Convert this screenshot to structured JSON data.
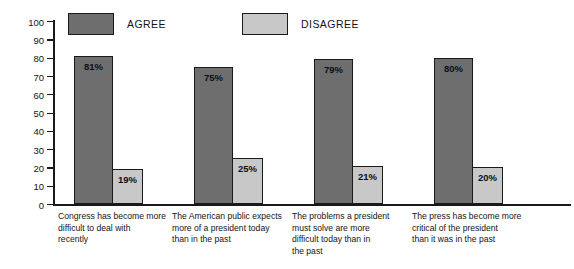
{
  "legend": {
    "entries": [
      {
        "label": "AGREE",
        "color": "#6e6e6e"
      },
      {
        "label": "DISAGREE",
        "color": "#c8c8c8"
      }
    ]
  },
  "axis": {
    "ylabel": "PERCENT OF TOTAL",
    "ticks": [
      "100",
      "90",
      "80",
      "70",
      "60",
      "50",
      "40",
      "30",
      "20",
      "10",
      "0"
    ]
  },
  "chart_data": {
    "type": "bar",
    "title": "",
    "xlabel": "",
    "ylabel": "PERCENT OF TOTAL",
    "ylim": [
      0,
      100
    ],
    "ytick_step": 10,
    "grid": false,
    "legend_position": "top",
    "categories": [
      "Congress has become more difficult to deal with recently",
      "The American public expects more of a president today than in the past",
      "The problems a president must solve are more difficult today than in the past",
      "The press has become more critical of the president than it was in the past"
    ],
    "category_lines": [
      [
        "Congress has become more",
        "difficult to deal with",
        "recently"
      ],
      [
        "The American public expects",
        "more of a president today",
        "than in the past"
      ],
      [
        "The problems a president",
        "must solve are more",
        "difficult today than in",
        "the past"
      ],
      [
        "The press has become more",
        "critical of the president",
        "than it was in the past"
      ]
    ],
    "series": [
      {
        "name": "AGREE",
        "color": "#6e6e6e",
        "values": [
          81,
          75,
          79,
          80
        ],
        "labels": [
          "81%",
          "75%",
          "79%",
          "80%"
        ]
      },
      {
        "name": "DISAGREE",
        "color": "#c8c8c8",
        "values": [
          19,
          25,
          21,
          20
        ],
        "labels": [
          "19%",
          "25%",
          "21%",
          "20%"
        ]
      }
    ]
  }
}
